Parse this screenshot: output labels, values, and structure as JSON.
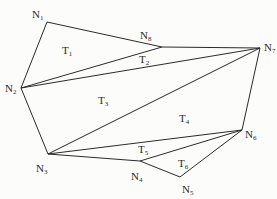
{
  "diagram": {
    "type": "triangulated-polygon",
    "line_color": "#2b2b2b",
    "nodes": [
      {
        "id": "N1",
        "base": "N",
        "sub": "1",
        "x": 47,
        "y": 22,
        "lx": 32,
        "ly": 9
      },
      {
        "id": "N2",
        "base": "N",
        "sub": "2",
        "x": 21,
        "y": 88,
        "lx": 5,
        "ly": 83
      },
      {
        "id": "N3",
        "base": "N",
        "sub": "3",
        "x": 48,
        "y": 154,
        "lx": 36,
        "ly": 163
      },
      {
        "id": "N4",
        "base": "N",
        "sub": "4",
        "x": 140,
        "y": 161,
        "lx": 131,
        "ly": 171
      },
      {
        "id": "N5",
        "base": "N",
        "sub": "5",
        "x": 180,
        "y": 177,
        "lx": 182,
        "ly": 184
      },
      {
        "id": "N6",
        "base": "N",
        "sub": "6",
        "x": 242,
        "y": 130,
        "lx": 245,
        "ly": 129
      },
      {
        "id": "N7",
        "base": "N",
        "sub": "7",
        "x": 260,
        "y": 48,
        "lx": 264,
        "ly": 42
      },
      {
        "id": "N8",
        "base": "N",
        "sub": "8",
        "x": 162,
        "y": 47,
        "lx": 140,
        "ly": 30
      }
    ],
    "edges": [
      [
        "N1",
        "N8"
      ],
      [
        "N1",
        "N2"
      ],
      [
        "N2",
        "N8"
      ],
      [
        "N8",
        "N7"
      ],
      [
        "N2",
        "N7"
      ],
      [
        "N2",
        "N3"
      ],
      [
        "N3",
        "N7"
      ],
      [
        "N7",
        "N6"
      ],
      [
        "N3",
        "N6"
      ],
      [
        "N3",
        "N4"
      ],
      [
        "N4",
        "N6"
      ],
      [
        "N4",
        "N5"
      ],
      [
        "N5",
        "N6"
      ]
    ],
    "triangles": [
      {
        "id": "T1",
        "base": "T",
        "sub": "1",
        "lx": 62,
        "ly": 45
      },
      {
        "id": "T2",
        "base": "T",
        "sub": "2",
        "lx": 139,
        "ly": 54
      },
      {
        "id": "T3",
        "base": "T",
        "sub": "3",
        "lx": 98,
        "ly": 95
      },
      {
        "id": "T4",
        "base": "T",
        "sub": "4",
        "lx": 179,
        "ly": 113
      },
      {
        "id": "T5",
        "base": "T",
        "sub": "5",
        "lx": 138,
        "ly": 144
      },
      {
        "id": "T6",
        "base": "T",
        "sub": "6",
        "lx": 178,
        "ly": 158
      }
    ]
  }
}
